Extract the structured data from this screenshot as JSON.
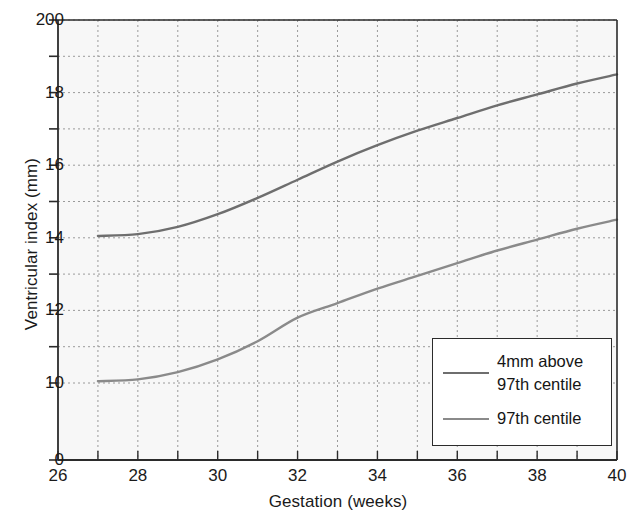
{
  "chart_data": {
    "type": "line",
    "title": "",
    "xlabel": "Gestation (weeks)",
    "ylabel": "Ventricular index (mm)",
    "xlim": [
      26,
      40
    ],
    "ylim": [
      10,
      20
    ],
    "grid": true,
    "y_axis_break": true,
    "y_zero_label": "0",
    "xticks": [
      26,
      28,
      30,
      32,
      34,
      36,
      38,
      40
    ],
    "xtick_labels": [
      "26",
      "28",
      "30",
      "32",
      "34",
      "36",
      "38",
      "40"
    ],
    "yticks": [
      20,
      18,
      16,
      14,
      12,
      10
    ],
    "ytick_labels": [
      "200",
      "18",
      "16",
      "14",
      "12",
      "10"
    ],
    "minor_yticks": [
      19,
      17,
      15,
      13,
      11
    ],
    "legend_position": "lower right",
    "series": [
      {
        "name": "4mm above\n97th centile",
        "color": "#6e6e6e",
        "x": [
          27,
          28,
          29,
          30,
          31,
          32,
          33,
          34,
          35,
          36,
          37,
          38,
          39,
          40
        ],
        "values": [
          14.05,
          14.1,
          14.3,
          14.65,
          15.1,
          15.6,
          16.1,
          16.55,
          16.95,
          17.3,
          17.65,
          17.95,
          18.25,
          18.5
        ]
      },
      {
        "name": "97th centile",
        "color": "#8a8a8a",
        "x": [
          27,
          28,
          29,
          30,
          31,
          32,
          33,
          34,
          35,
          36,
          37,
          38,
          39,
          40
        ],
        "values": [
          10.05,
          10.1,
          10.3,
          10.65,
          11.15,
          11.8,
          12.2,
          12.6,
          12.95,
          13.3,
          13.65,
          13.95,
          14.25,
          14.5
        ]
      }
    ]
  },
  "axes": {
    "y_title": "Ventricular index (mm)",
    "x_title": "Gestation (weeks)"
  },
  "legend": {
    "entries": [
      {
        "label": "4mm above\n97th centile",
        "color": "#6e6e6e"
      },
      {
        "label": "97th centile",
        "color": "#8a8a8a"
      }
    ]
  },
  "colors": {
    "plot_background": "#f7f7f7",
    "grid": "#9a9a9a",
    "axis": "#2b2b2b",
    "series_upper": "#6e6e6e",
    "series_lower": "#8a8a8a",
    "text": "#1a1a1a"
  }
}
